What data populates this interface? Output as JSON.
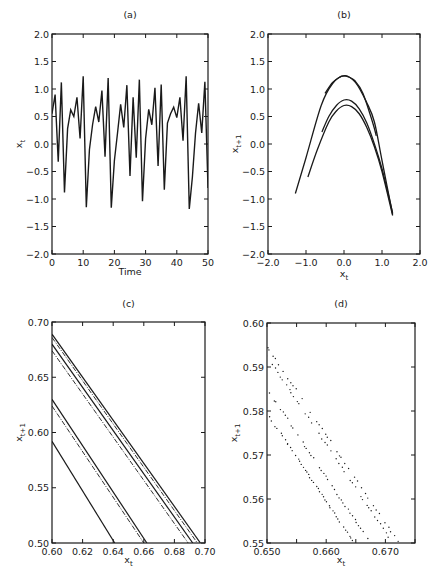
{
  "chart_data": [
    {
      "id": "a",
      "type": "line",
      "title": "(a)",
      "xlabel": "Time",
      "ylabel": "x_t",
      "xlim": [
        0,
        50
      ],
      "ylim": [
        -2.0,
        2.0
      ],
      "xticks": [
        0,
        10,
        20,
        30,
        40,
        50
      ],
      "xtick_labels": [
        "0",
        "10",
        "20",
        "30",
        "40",
        "50"
      ],
      "yticks": [
        -2.0,
        -1.5,
        -1.0,
        -0.5,
        0.0,
        0.5,
        1.0,
        1.5,
        2.0
      ],
      "ytick_labels": [
        "-2.0",
        "-1.5",
        "-1.0",
        "-0.5",
        "0.0",
        "0.5",
        "1.0",
        "1.5",
        "2.0"
      ],
      "grid": false,
      "series": [
        {
          "name": "x_t",
          "x": [
            0,
            1,
            2,
            3,
            4,
            5,
            6,
            7,
            8,
            9,
            10,
            11,
            12,
            13,
            14,
            15,
            16,
            17,
            18,
            19,
            20,
            21,
            22,
            23,
            24,
            25,
            26,
            27,
            28,
            29,
            30,
            31,
            32,
            33,
            34,
            35,
            36,
            37,
            38,
            39,
            40,
            41,
            42,
            43,
            44,
            45,
            46,
            47,
            48,
            49,
            50
          ],
          "values": [
            0.55,
            0.9,
            -0.32,
            1.12,
            -0.88,
            0.28,
            0.62,
            0.5,
            0.85,
            0.1,
            1.23,
            -1.15,
            -0.1,
            0.35,
            0.68,
            0.4,
            0.97,
            -0.23,
            1.2,
            -1.16,
            -0.3,
            0.2,
            0.72,
            0.3,
            1.07,
            -0.58,
            0.85,
            -0.25,
            1.17,
            -1.04,
            0.1,
            0.63,
            0.35,
            1.02,
            -0.4,
            1.08,
            -0.83,
            0.38,
            0.55,
            0.67,
            0.48,
            0.85,
            0.06,
            1.23,
            -1.18,
            -0.6,
            0.2,
            0.74,
            0.2,
            1.13,
            -0.8
          ]
        }
      ]
    },
    {
      "id": "b",
      "type": "line",
      "title": "(b)",
      "xlabel": "x_t",
      "ylabel": "x_{t+1}",
      "xlim": [
        -2.0,
        2.0
      ],
      "ylim": [
        -2.0,
        2.0
      ],
      "xticks": [
        -2.0,
        -1.0,
        0.0,
        1.0,
        2.0
      ],
      "xtick_labels": [
        "-2.0",
        "-1.0",
        "0.0",
        "1.0",
        "2.0"
      ],
      "yticks": [
        -2.0,
        -1.5,
        -1.0,
        -0.5,
        0.0,
        0.5,
        1.0,
        1.5,
        2.0
      ],
      "ytick_labels": [
        "-2.0",
        "-1.5",
        "-1.0",
        "-0.5",
        "0.0",
        "0.5",
        "1.0",
        "1.5",
        "2.0"
      ],
      "grid": false,
      "series": [
        {
          "name": "outer branch 1",
          "x": [
            -1.28,
            -1.0,
            -0.6,
            -0.3,
            0.0,
            0.3,
            0.6,
            0.8,
            1.0,
            1.28
          ],
          "values": [
            -0.9,
            -0.25,
            0.7,
            1.1,
            1.24,
            1.12,
            0.75,
            0.4,
            -0.3,
            -1.28
          ]
        },
        {
          "name": "outer branch 2",
          "x": [
            -0.5,
            -0.3,
            -0.1,
            0.0,
            0.1,
            0.3,
            0.5,
            0.75,
            0.85
          ],
          "values": [
            0.92,
            1.12,
            1.22,
            1.24,
            1.23,
            1.14,
            0.92,
            0.4,
            0.15
          ]
        },
        {
          "name": "inner branch 1",
          "x": [
            -0.58,
            -0.4,
            -0.2,
            0.0,
            0.2,
            0.4,
            0.6,
            0.8,
            1.0,
            1.28
          ],
          "values": [
            0.22,
            0.5,
            0.7,
            0.8,
            0.78,
            0.64,
            0.38,
            0.0,
            -0.45,
            -1.25
          ]
        },
        {
          "name": "inner branch 2",
          "x": [
            -0.95,
            -0.7,
            -0.4,
            -0.2,
            0.0,
            0.2,
            0.4,
            0.6,
            0.8,
            1.0,
            1.28
          ],
          "values": [
            -0.6,
            -0.1,
            0.4,
            0.6,
            0.7,
            0.68,
            0.55,
            0.3,
            -0.05,
            -0.5,
            -1.3
          ]
        }
      ]
    },
    {
      "id": "c",
      "type": "line",
      "title": "(c)",
      "xlabel": "x_t",
      "ylabel": "x_{t+1}",
      "xlim": [
        0.6,
        0.7
      ],
      "ylim": [
        0.5,
        0.7
      ],
      "xticks": [
        0.6,
        0.62,
        0.64,
        0.66,
        0.68,
        0.7
      ],
      "xtick_labels": [
        "0.60",
        "0.62",
        "0.64",
        "0.66",
        "0.68",
        "0.70"
      ],
      "yticks": [
        0.5,
        0.55,
        0.6,
        0.65,
        0.7
      ],
      "ytick_labels": [
        "0.50",
        "0.55",
        "0.60",
        "0.65",
        "0.70"
      ],
      "grid": false,
      "series": [
        {
          "name": "band 1a",
          "x": [
            0.6,
            0.697
          ],
          "values": [
            0.689,
            0.5
          ]
        },
        {
          "name": "band 1b",
          "x": [
            0.6,
            0.695
          ],
          "values": [
            0.686,
            0.5
          ]
        },
        {
          "name": "band 1c",
          "x": [
            0.6,
            0.692
          ],
          "values": [
            0.68,
            0.5
          ]
        },
        {
          "name": "band 1d",
          "x": [
            0.6,
            0.689
          ],
          "values": [
            0.674,
            0.5
          ]
        },
        {
          "name": "band 2a",
          "x": [
            0.6,
            0.662
          ],
          "values": [
            0.63,
            0.5
          ]
        },
        {
          "name": "band 2b",
          "x": [
            0.6,
            0.66
          ],
          "values": [
            0.624,
            0.5
          ]
        },
        {
          "name": "band 3",
          "x": [
            0.6,
            0.641
          ],
          "values": [
            0.592,
            0.5
          ]
        }
      ]
    },
    {
      "id": "d",
      "type": "scatter",
      "title": "(d)",
      "xlabel": "x_t",
      "ylabel": "x_{t+1}",
      "xlim": [
        0.65,
        0.675
      ],
      "ylim": [
        0.55,
        0.6
      ],
      "xticks": [
        0.65,
        0.655,
        0.66,
        0.665,
        0.67,
        0.675
      ],
      "xtick_labels": [
        "0.650",
        "",
        "0.660",
        "",
        "0.670",
        ""
      ],
      "yticks": [
        0.55,
        0.56,
        0.57,
        0.58,
        0.59,
        0.6
      ],
      "ytick_labels": [
        "0.55",
        "0.56",
        "0.57",
        "0.58",
        "0.59",
        "0.60"
      ],
      "grid": false,
      "series": [
        {
          "name": "dotted band 1",
          "x": [
            0.65,
            0.672
          ],
          "values": [
            0.5945,
            0.5505
          ]
        },
        {
          "name": "dotted band 2",
          "x": [
            0.65,
            0.671
          ],
          "values": [
            0.5925,
            0.5505
          ]
        },
        {
          "name": "dotted band 3",
          "x": [
            0.6505,
            0.667
          ],
          "values": [
            0.584,
            0.551
          ]
        },
        {
          "name": "dotted band 4",
          "x": [
            0.6505,
            0.6645
          ],
          "values": [
            0.5785,
            0.5505
          ]
        }
      ]
    }
  ]
}
